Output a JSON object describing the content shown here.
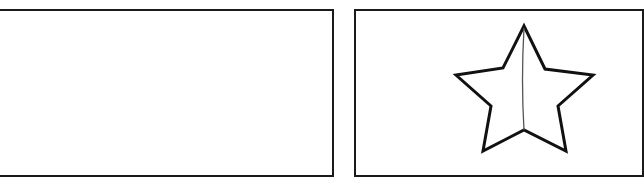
{
  "panels": [
    {
      "id": "left",
      "content": "empty",
      "border_color": "#1a1a1a"
    },
    {
      "id": "right",
      "content": "star",
      "border_color": "#1a1a1a",
      "star": {
        "shape": "five-pointed-star-outline",
        "stroke_color": "#111111",
        "fill": "#ffffff",
        "divider_line_color": "#555555",
        "points": "524,26 545,69 593,75 558,106 566,151 524,130 483,151 491,106 456,75 503,68",
        "divider": {
          "x1": 524,
          "y1": 28,
          "x2": 524,
          "y2": 130
        }
      }
    }
  ]
}
